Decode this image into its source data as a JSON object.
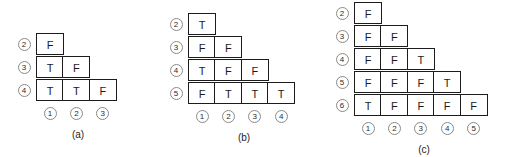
{
  "figure": {
    "background_color": "#ffffff",
    "cell_border_color": "#1c1c1c",
    "label_circle_color": "#8a8a8a",
    "text_color": "#1b1b1b"
  },
  "chart_data": {
    "type": "table",
    "title": "",
    "panels": [
      {
        "id": "a",
        "caption": "(a)",
        "row_labels": [
          "2",
          "3",
          "4"
        ],
        "col_labels": [
          "1",
          "2",
          "3"
        ],
        "rows": [
          [
            "F"
          ],
          [
            "T",
            "F"
          ],
          [
            "T",
            "T",
            "F"
          ]
        ]
      },
      {
        "id": "b",
        "caption": "(b)",
        "row_labels": [
          "2",
          "3",
          "4",
          "5"
        ],
        "col_labels": [
          "1",
          "2",
          "3",
          "4"
        ],
        "rows": [
          [
            "T"
          ],
          [
            "F",
            "F"
          ],
          [
            "T",
            "F",
            "F"
          ],
          [
            "F",
            "T",
            "T",
            "T"
          ]
        ]
      },
      {
        "id": "c",
        "caption": "(c)",
        "row_labels": [
          "2",
          "3",
          "4",
          "5",
          "6"
        ],
        "col_labels": [
          "1",
          "2",
          "3",
          "4",
          "5"
        ],
        "rows": [
          [
            "F"
          ],
          [
            "F",
            "F"
          ],
          [
            "F",
            "F",
            "T"
          ],
          [
            "F",
            "F",
            "F",
            "T"
          ],
          [
            "T",
            "F",
            "F",
            "F",
            "F"
          ]
        ]
      }
    ]
  }
}
